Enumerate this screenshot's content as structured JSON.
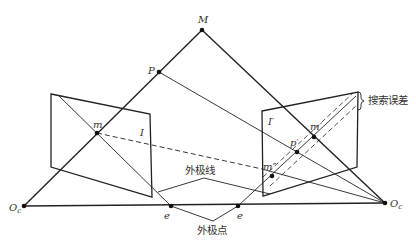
{
  "diagram": {
    "colors": {
      "line": "#222222",
      "text": "#333333",
      "background": "#ffffff"
    },
    "points": {
      "M": {
        "label": "M",
        "x": 202,
        "y": 30
      },
      "P": {
        "label": "P",
        "x": 159,
        "y": 72
      },
      "m": {
        "label": "m",
        "x": 97,
        "y": 133
      },
      "Oc": {
        "label": "O",
        "sub": "c",
        "x": 24,
        "y": 206
      },
      "Oc2": {
        "label": "O",
        "sub": "c",
        "prime": "′",
        "x": 385,
        "y": 203
      },
      "e": {
        "label": "e",
        "x": 171,
        "y": 206
      },
      "e2": {
        "label": "e",
        "x": 238,
        "y": 206
      },
      "m1": {
        "label": "m′",
        "x": 314,
        "y": 137
      },
      "p1": {
        "label": "p′",
        "x": 297,
        "y": 152
      },
      "m2": {
        "label": "m″",
        "x": 272,
        "y": 176
      }
    },
    "planes": {
      "left": {
        "label": "I"
      },
      "right": {
        "label": "I′"
      }
    },
    "annotations": {
      "epipolar_line": "外极线",
      "epipole": "外极点",
      "search_error": "搜索误差"
    }
  }
}
